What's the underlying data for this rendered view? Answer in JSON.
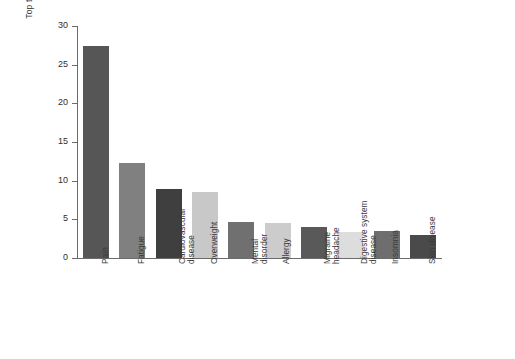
{
  "chart_data": {
    "type": "bar",
    "title": "",
    "subtitle": "",
    "xlabel": "",
    "ylabel": "Top ten conditions (%)",
    "ylim": [
      0,
      30
    ],
    "yticks": [
      0,
      5,
      10,
      15,
      20,
      25,
      30
    ],
    "grid": false,
    "legend": "none",
    "categories": [
      "Pain",
      "Fatigue",
      "Cardiovascular\ndisease",
      "Overweight",
      "Mental\ndisorder",
      "Allergy",
      "Migraine\nheadache",
      "Digestive system\ndisease",
      "Insomnia",
      "Skin disease"
    ],
    "values": [
      27.4,
      12.3,
      8.9,
      8.5,
      4.6,
      4.5,
      4.0,
      3.4,
      3.5,
      3.0
    ],
    "bar_colors": [
      "#565656",
      "#808080",
      "#3f3f3f",
      "#c8c8c8",
      "#707070",
      "#cccccc",
      "#595959",
      "#dddddd",
      "#6e6e6e",
      "#4a4a4a"
    ]
  },
  "axis": {
    "y_title": "Top ten conditions (%)",
    "tick_labels": [
      "0",
      "5",
      "10",
      "15",
      "20",
      "25",
      "30"
    ],
    "axis_color": "#6b6b6b"
  }
}
